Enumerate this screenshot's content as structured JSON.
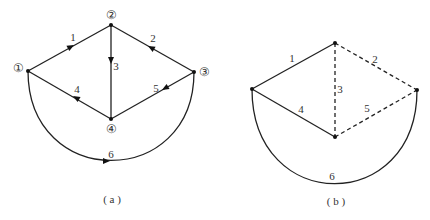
{
  "figures": [
    {
      "id": "a",
      "caption": "( a )",
      "graph_type": "directed",
      "nodes": [
        {
          "id": "1",
          "label": "①",
          "x": 28,
          "y": 71
        },
        {
          "id": "2",
          "label": "②",
          "x": 111,
          "y": 25
        },
        {
          "id": "3",
          "label": "③",
          "x": 194,
          "y": 72
        },
        {
          "id": "4",
          "label": "④",
          "x": 111,
          "y": 119
        }
      ],
      "edges": [
        {
          "id": "1",
          "label": "1",
          "from": "1",
          "to": "2",
          "style": "solid"
        },
        {
          "id": "2",
          "label": "2",
          "from": "3",
          "to": "2",
          "style": "solid"
        },
        {
          "id": "3",
          "label": "3",
          "from": "2",
          "to": "4",
          "style": "solid"
        },
        {
          "id": "4",
          "label": "4",
          "from": "4",
          "to": "1",
          "style": "solid"
        },
        {
          "id": "5",
          "label": "5",
          "from": "3",
          "to": "4",
          "style": "solid"
        },
        {
          "id": "6",
          "label": "6",
          "from": "1",
          "to": "3",
          "style": "solid",
          "shape": "arc"
        }
      ]
    },
    {
      "id": "b",
      "caption": "( b )",
      "graph_type": "undirected",
      "nodes": [
        {
          "id": "1",
          "label": "",
          "x": 252,
          "y": 89
        },
        {
          "id": "2",
          "label": "",
          "x": 335,
          "y": 43
        },
        {
          "id": "3",
          "label": "",
          "x": 417,
          "y": 90
        },
        {
          "id": "4",
          "label": "",
          "x": 335,
          "y": 137
        }
      ],
      "edges": [
        {
          "id": "1",
          "label": "1",
          "from": "1",
          "to": "2",
          "style": "solid"
        },
        {
          "id": "2",
          "label": "2",
          "from": "2",
          "to": "3",
          "style": "dashed"
        },
        {
          "id": "3",
          "label": "3",
          "from": "2",
          "to": "4",
          "style": "dashed"
        },
        {
          "id": "4",
          "label": "4",
          "from": "1",
          "to": "4",
          "style": "solid"
        },
        {
          "id": "5",
          "label": "5",
          "from": "4",
          "to": "3",
          "style": "dashed"
        },
        {
          "id": "6",
          "label": "6",
          "from": "1",
          "to": "3",
          "style": "solid",
          "shape": "arc"
        }
      ]
    }
  ],
  "labels": {
    "a": {
      "n1": "①",
      "n2": "②",
      "n3": "③",
      "n4": "④",
      "e1": "1",
      "e2": "2",
      "e3": "3",
      "e4": "4",
      "e5": "5",
      "e6": "6",
      "caption": "( a )"
    },
    "b": {
      "e1": "1",
      "e2": "2",
      "e3": "3",
      "e4": "4",
      "e5": "5",
      "e6": "6",
      "caption": "( b )"
    }
  }
}
